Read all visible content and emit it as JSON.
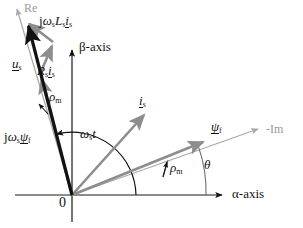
{
  "figure": {
    "type": "space-vector phasor diagram",
    "title": "",
    "background_color": "#ffffff",
    "colors": {
      "black": "#121212",
      "gray_vector": "#8d8d8d",
      "light_gray_axis": "#a8a8a8",
      "axis_black": "#1a1a1a"
    }
  },
  "origin": {
    "label": "0",
    "x": 72,
    "y": 195
  },
  "axes": [
    {
      "name": "alpha-axis",
      "label_html": "&alpha;-axis",
      "color": "#1a1a1a",
      "from": {
        "x": 15,
        "y": 195
      },
      "to": {
        "x": 226,
        "y": 195
      },
      "label_pos": {
        "x": 232,
        "y": 188
      },
      "font_size": 13
    },
    {
      "name": "beta-axis",
      "label_html": "&beta;-axis",
      "color": "#1a1a1a",
      "from": {
        "x": 72,
        "y": 222
      },
      "to": {
        "x": 72,
        "y": 47
      },
      "label_pos": {
        "x": 79,
        "y": 41
      },
      "font_size": 13
    },
    {
      "name": "re-axis",
      "label_html": "Re",
      "color": "#a8a8a8",
      "from": {
        "x": 72,
        "y": 195
      },
      "to": {
        "x": 16,
        "y": 7
      },
      "label_pos": {
        "x": 24,
        "y": 2
      },
      "font_size": 12
    },
    {
      "name": "minus-im-axis",
      "label_html": "-Im",
      "color": "#a8a8a8",
      "from": {
        "x": 72,
        "y": 195
      },
      "to": {
        "x": 262,
        "y": 128
      },
      "label_pos": {
        "x": 266,
        "y": 124
      },
      "font_size": 12
    }
  ],
  "vectors": [
    {
      "name": "u-s",
      "label_html": "<span class='uline mathi'>u</span><sub>s</sub>",
      "color": "#121212",
      "width": 3.2,
      "from": {
        "x": 72,
        "y": 195
      },
      "to": {
        "x": 26,
        "y": 21
      },
      "label_pos": {
        "x": 13,
        "y": 58
      },
      "font_size": 13
    },
    {
      "name": "jws-psi-f",
      "label_html": "j<span class='mathi'>&omega;</span><sub>s</sub><span class='uline mathi'>&psi;</span><sub>f</sub>",
      "color": "#8d8d8d",
      "width": 2.6,
      "from": {
        "x": 72,
        "y": 195
      },
      "to": {
        "x": 40,
        "y": 74
      },
      "label_pos": {
        "x": 4,
        "y": 133
      },
      "font_size": 13
    },
    {
      "name": "rs-is",
      "label_html": "<span class='mathi'>R</span><sub>s</sub><span class='uline mathi'>i</span><sub>s</sub>",
      "color": "#8d8d8d",
      "width": 2.6,
      "from": {
        "x": 40,
        "y": 74
      },
      "to": {
        "x": 53,
        "y": 42
      },
      "label_pos": {
        "x": 37,
        "y": 68
      },
      "font_size": 13
    },
    {
      "name": "jws-ls-is",
      "label_html": "j<span class='mathi'>&omega;</span><sub>s</sub><span class='mathi'>L</span><sub>s</sub><span class='uline mathi'>i</span><sub>s</sub>",
      "color": "#8d8d8d",
      "width": 2.6,
      "from": {
        "x": 53,
        "y": 42
      },
      "to": {
        "x": 26,
        "y": 21
      },
      "label_pos": {
        "x": 39,
        "y": 21
      },
      "font_size": 13
    },
    {
      "name": "i-s",
      "label_html": "<span class='uline mathi'>i</span><sub>s</sub>",
      "color": "#8d8d8d",
      "width": 2.6,
      "from": {
        "x": 72,
        "y": 195
      },
      "to": {
        "x": 148,
        "y": 110
      },
      "label_pos": {
        "x": 141,
        "y": 96
      },
      "font_size": 13
    },
    {
      "name": "psi-f",
      "label_html": "<span class='uline mathi'>&psi;</span><sub>f</sub>",
      "color": "#8d8d8d",
      "width": 2.6,
      "from": {
        "x": 72,
        "y": 195
      },
      "to": {
        "x": 208,
        "y": 140
      },
      "label_pos": {
        "x": 212,
        "y": 123
      },
      "font_size": 13
    }
  ],
  "angles": [
    {
      "name": "omega-s-t",
      "label_html": "<span class='mathi'>&omega;</span><sub>s</sub><span class='mathi'>t</span>",
      "color": "#121212",
      "radius": 64,
      "start_deg": 0,
      "end_deg": 104,
      "label_pos": {
        "x": 81,
        "y": 129
      },
      "font_size": 13
    },
    {
      "name": "rho-m-left",
      "label_html": "<span class='mathi'>&rho;</span><sub>m</sub>",
      "color": "#121212",
      "label_pos": {
        "x": 49,
        "y": 92
      },
      "font_size": 13
    },
    {
      "name": "rho-m-right",
      "label_html": "<span class='mathi'>&rho;</span><sub>m</sub>",
      "color": "#121212",
      "label_pos": {
        "x": 172,
        "y": 163
      },
      "font_size": 13
    },
    {
      "name": "theta",
      "label_html": "<span class='mathi'>&theta;</span>",
      "color": "#121212",
      "radius": 134,
      "start_deg": 0,
      "end_deg": 19,
      "label_pos": {
        "x": 206,
        "y": 160
      },
      "font_size": 13
    }
  ]
}
